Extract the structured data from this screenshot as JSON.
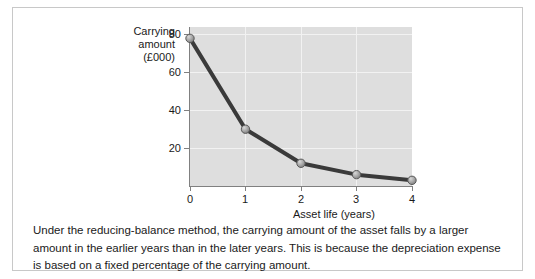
{
  "chart_data": {
    "type": "line",
    "title": "",
    "subtitle": "",
    "xlabel": "Asset life (years)",
    "ylabel": "Carrying amount (£000)",
    "ylabel_lines": [
      "Carrying",
      "amount",
      "(£000)"
    ],
    "x": [
      0,
      1,
      2,
      3,
      4
    ],
    "values": [
      78,
      30,
      12,
      6,
      3
    ],
    "series": [
      {
        "name": "Carrying amount",
        "values": [
          78,
          30,
          12,
          6,
          3
        ]
      }
    ],
    "xticklabels": [
      "0",
      "1",
      "2",
      "3",
      "4"
    ],
    "yticklabels": [
      "20",
      "40",
      "60",
      "80"
    ],
    "yticks": [
      20,
      40,
      60,
      80
    ],
    "xlim": [
      0,
      4
    ],
    "ylim": [
      0,
      84
    ],
    "grid": true,
    "legend": "none",
    "line_color": "#3a3a3a",
    "marker_color": "#9a9a9a",
    "plot_background": "#dedede",
    "gridline_color": "#f2f2f2",
    "axis_color": "#808080"
  },
  "caption": {
    "text": "Under the reducing-balance method, the carrying amount of the asset falls by a larger amount in the earlier years than in the later years. This is because the depreciation expense is based on a fixed percentage of the carrying amount."
  }
}
